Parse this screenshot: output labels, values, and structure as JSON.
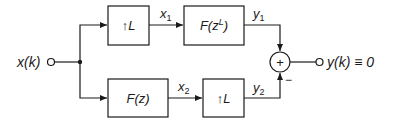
{
  "diagram": {
    "input": {
      "label": "x(k)"
    },
    "output": {
      "label": "y(k) ≡ 0"
    },
    "blocks": [
      {
        "id": "up_top",
        "arrow": "↑",
        "label": "L"
      },
      {
        "id": "filter_top",
        "label": "F(z",
        "sup": "L",
        "close": ")"
      },
      {
        "id": "filter_bottom",
        "label": "F(z)"
      },
      {
        "id": "up_bottom",
        "arrow": "↑",
        "label": "L"
      }
    ],
    "signals": {
      "x1": {
        "base": "x",
        "sub": "1"
      },
      "x2": {
        "base": "x",
        "sub": "2"
      },
      "y1": {
        "base": "y",
        "sub": "1"
      },
      "y2": {
        "base": "y",
        "sub": "2"
      }
    },
    "summer": {
      "symbol": "+",
      "minus_sign": "−"
    },
    "colors": {
      "stroke": "#1a1a1a",
      "background": "#ffffff"
    }
  }
}
